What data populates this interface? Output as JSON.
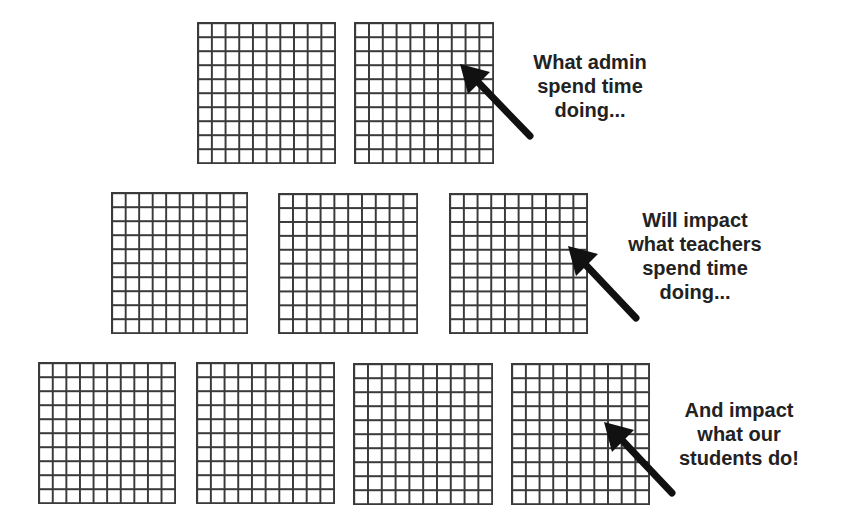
{
  "diagram": {
    "grid_size": "10x10",
    "rows": [
      {
        "level": "admin",
        "grid_count": 2,
        "caption_lines": [
          "What admin",
          "spend time",
          "doing..."
        ]
      },
      {
        "level": "teachers",
        "grid_count": 3,
        "caption_lines": [
          "Will impact",
          "what teachers",
          "spend time",
          "doing..."
        ]
      },
      {
        "level": "students",
        "grid_count": 4,
        "caption_lines": [
          "And impact",
          "what our",
          "students do!"
        ]
      }
    ],
    "colors": {
      "grid_line": "#3a3a3a",
      "arrow": "#111111",
      "text": "#222222",
      "background": "#ffffff"
    }
  }
}
